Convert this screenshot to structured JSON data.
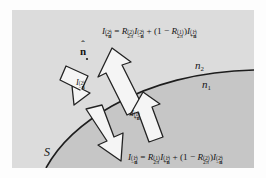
{
  "figure": {
    "name": "radiative-transfer-interface-diagram",
    "colors": {
      "page_background": "#fdfdfd",
      "medium_lower_fill": "#c9c9c9",
      "medium_upper_fill": "#d6d6d6",
      "arrow_fill": "#f4f4f4",
      "stroke": "#1f1f1f",
      "text": "#141414"
    }
  },
  "equations": {
    "top": {
      "lhs_symbol": "I",
      "lhs_superscript": "(2)",
      "lhs_subscript": "+n̂",
      "plain": "I^(2)_{+n̂} = R^(2)_{2π} I^(2)_{−n̂} + (1 − R^(1)_{2π}) I^(1)_{+n̂}"
    },
    "bottom": {
      "lhs_symbol": "I",
      "lhs_superscript": "(1)",
      "lhs_subscript": "−n̂",
      "plain": "I^(1)_{−n̂} = R^(1)_{2π} I^(1)_{+n̂} + (1 − R^(2)_{2π}) I^(2)_{−n̂}"
    }
  },
  "labels": {
    "normal_vector": "n̂",
    "medium_upper": "n₂",
    "medium_lower": "n₁",
    "surface": "S",
    "arrow_incident_upper": "I^(2)_{−n̂}",
    "arrow_incident_lower": "I^(1)_{+n̂}"
  },
  "arrows": [
    {
      "name": "incident-downward-from-medium-2",
      "label": "I^(2)_{−n̂}",
      "direction": "down-right",
      "meaning": "radiance arriving at surface from medium 2"
    },
    {
      "name": "outgoing-upward-into-medium-2",
      "label": "I^(2)_{+n̂}",
      "direction": "up-right",
      "meaning": "radiance leaving surface into medium 2"
    },
    {
      "name": "incident-upward-from-medium-1",
      "label": "I^(1)_{+n̂}",
      "direction": "up-right",
      "meaning": "radiance arriving at surface from medium 1"
    },
    {
      "name": "outgoing-downward-into-medium-1",
      "label": "I^(1)_{−n̂}",
      "direction": "down-right",
      "meaning": "radiance leaving surface into medium 1"
    }
  ]
}
